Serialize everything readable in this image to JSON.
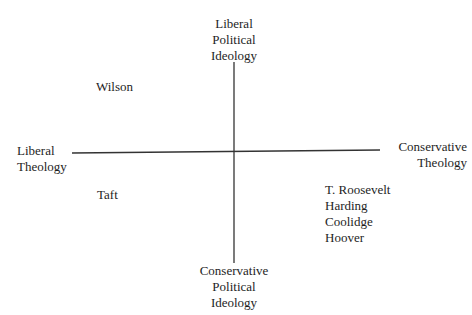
{
  "diagram": {
    "type": "quadrant",
    "axes": {
      "vertical": {
        "top_label": [
          "Liberal",
          "Political",
          "Ideology"
        ],
        "bottom_label": [
          "Conservative",
          "Political",
          "Ideology"
        ]
      },
      "horizontal": {
        "left_label": [
          "Liberal",
          "Theology"
        ],
        "right_label": [
          "Conservative",
          "Theology"
        ]
      }
    },
    "quadrants": {
      "liberal_theology_liberal_politics": [
        "Wilson"
      ],
      "liberal_theology_conservative_politics": [
        "Taft"
      ],
      "conservative_theology_liberal_politics": [],
      "conservative_theology_conservative_politics": [
        "T. Roosevelt",
        "Harding",
        "Coolidge",
        "Hoover"
      ]
    },
    "colors": {
      "line": "#333333",
      "text": "#1e1e1e",
      "background": "#ffffff"
    }
  }
}
